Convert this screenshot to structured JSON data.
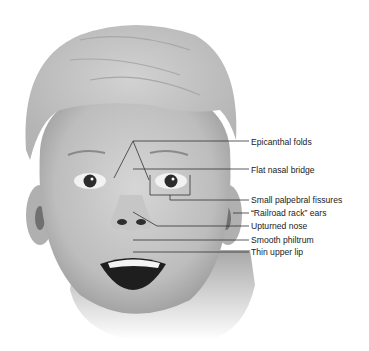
{
  "figure": {
    "labels": [
      {
        "text": "Epicanthal folds",
        "y": 142
      },
      {
        "text": "Flat nasal bridge",
        "y": 170
      },
      {
        "text": "Small palpebral fissures",
        "y": 198
      },
      {
        "text": "“Railroad rack” ears",
        "y": 211
      },
      {
        "text": "Upturned nose",
        "y": 224
      },
      {
        "text": "Smooth philtrum",
        "y": 238
      },
      {
        "text": "Thin upper lip",
        "y": 250
      }
    ],
    "colors": {
      "line": "#333333",
      "text": "#222222",
      "skin": "#c8c8c8",
      "hair": "#c4c4c4",
      "background": "#ffffff"
    }
  }
}
